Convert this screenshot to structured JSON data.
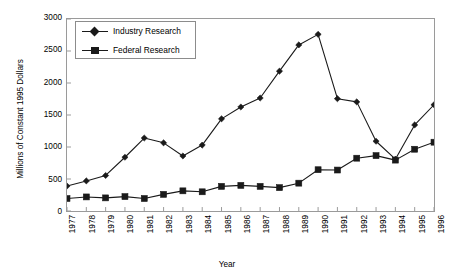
{
  "chart_data": {
    "type": "line",
    "title": "",
    "xlabel": "Year",
    "ylabel": "Millions of Constant 1995 Dollars",
    "ylim": [
      0,
      3000
    ],
    "yticks": [
      0,
      500,
      1000,
      1500,
      2000,
      2500,
      3000
    ],
    "ytick_labels": [
      "0",
      "500",
      "1000",
      "1500",
      "2000",
      "2500",
      "3000"
    ],
    "grid": false,
    "legend_position": "upper-left-inside",
    "categories": [
      "1977",
      "1978",
      "1979",
      "1980",
      "1981",
      "1982",
      "1983",
      "1984",
      "1985",
      "1986",
      "1987",
      "1988",
      "1989",
      "1990",
      "1991",
      "1992",
      "1993",
      "1994",
      "1995",
      "1996"
    ],
    "x": [
      1977,
      1978,
      1979,
      1980,
      1981,
      1982,
      1983,
      1984,
      1985,
      1986,
      1987,
      1988,
      1989,
      1990,
      1991,
      1992,
      1993,
      1994,
      1995,
      1996
    ],
    "series": [
      {
        "name": "Industry Research",
        "marker": "diamond",
        "color": "#1a1a1a",
        "values": [
          390,
          470,
          555,
          840,
          1140,
          1065,
          860,
          1030,
          1440,
          1625,
          1765,
          2185,
          2595,
          2760,
          1755,
          1705,
          1090,
          810,
          1345,
          1660
        ]
      },
      {
        "name": "Federal Research",
        "marker": "square",
        "color": "#1a1a1a",
        "values": [
          195,
          220,
          205,
          225,
          195,
          260,
          315,
          300,
          385,
          400,
          385,
          365,
          435,
          645,
          640,
          825,
          865,
          795,
          965,
          1075
        ]
      }
    ]
  },
  "legend": {
    "entries": [
      {
        "label": "Industry Research"
      },
      {
        "label": "Federal Research"
      }
    ]
  },
  "axes": {
    "y_title": "Millions of Constant 1995 Dollars",
    "x_title": "Year"
  },
  "colors": {
    "line": "#1a1a1a",
    "axis": "#9a9a9a",
    "legend_border": "#8c8c8c",
    "background": "#ffffff"
  }
}
